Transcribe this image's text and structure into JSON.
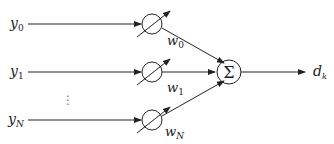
{
  "diagram": {
    "inputs": [
      {
        "label": "y",
        "sub": "0",
        "weight": "w",
        "weight_sub": "0"
      },
      {
        "label": "y",
        "sub": "1",
        "weight": "w",
        "weight_sub": "1"
      },
      {
        "label": "y",
        "sub": "N",
        "weight": "w",
        "weight_sub": "N"
      }
    ],
    "ellipsis": "⋮",
    "sum_symbol": "Σ",
    "output": {
      "label": "d",
      "sub": "k"
    },
    "colors": {
      "line": "#222222",
      "background": "#ffffff"
    }
  }
}
